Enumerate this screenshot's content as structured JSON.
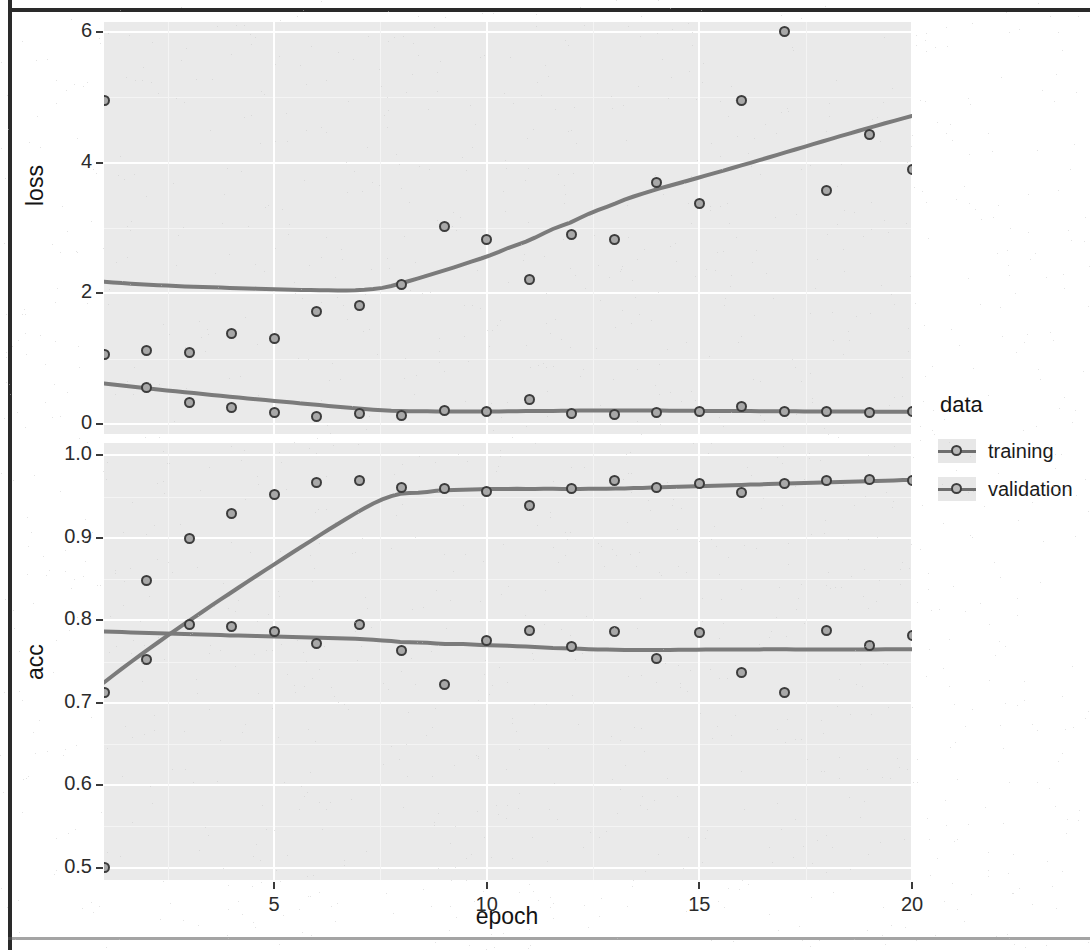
{
  "axis": {
    "x_title": "epoch",
    "x_ticks": [
      "5",
      "10",
      "15",
      "20"
    ],
    "loss_title": "loss",
    "loss_ticks": [
      "0",
      "2",
      "4",
      "6"
    ],
    "acc_title": "acc",
    "acc_ticks": [
      "0.5",
      "0.6",
      "0.7",
      "0.8",
      "0.9",
      "1.0"
    ]
  },
  "legend": {
    "title": "data",
    "items": [
      {
        "label": "training",
        "color": "#7b7b7b"
      },
      {
        "label": "validation",
        "color": "#7b7b7b"
      }
    ]
  },
  "chart_data": [
    {
      "type": "scatter",
      "panel": "loss",
      "title": "",
      "xlabel": "epoch",
      "ylabel": "loss",
      "xlim": [
        1,
        20
      ],
      "ylim": [
        -0.15,
        6.15
      ],
      "xticks": [
        5,
        10,
        15,
        20
      ],
      "yticks": [
        0,
        2,
        4,
        6
      ],
      "grid": true,
      "legend_position": "right",
      "smoother": "loess",
      "x": [
        1,
        2,
        3,
        4,
        5,
        6,
        7,
        8,
        9,
        10,
        11,
        12,
        13,
        14,
        15,
        16,
        17,
        18,
        19,
        20
      ],
      "series": [
        {
          "name": "training",
          "values": [
            1.06,
            0.56,
            0.33,
            0.25,
            0.18,
            0.12,
            0.16,
            0.14,
            0.21,
            0.2,
            0.37,
            0.16,
            0.15,
            0.18,
            0.2,
            0.27,
            0.19,
            0.19,
            0.18,
            0.19
          ]
        },
        {
          "name": "validation",
          "values": [
            4.95,
            1.12,
            1.1,
            1.39,
            1.31,
            1.72,
            1.81,
            2.13,
            3.03,
            2.83,
            2.21,
            2.9,
            2.82,
            3.69,
            3.37,
            4.95,
            6.0,
            3.58,
            4.43,
            3.89
          ]
        }
      ]
    },
    {
      "type": "scatter",
      "panel": "acc",
      "title": "",
      "xlabel": "epoch",
      "ylabel": "acc",
      "xlim": [
        1,
        20
      ],
      "ylim": [
        0.485,
        1.015
      ],
      "xticks": [
        5,
        10,
        15,
        20
      ],
      "yticks": [
        0.5,
        0.6,
        0.7,
        0.8,
        0.9,
        1.0
      ],
      "grid": true,
      "legend_position": "right",
      "smoother": "loess",
      "x": [
        1,
        2,
        3,
        4,
        5,
        6,
        7,
        8,
        9,
        10,
        11,
        12,
        13,
        14,
        15,
        16,
        17,
        18,
        19,
        20
      ],
      "series": [
        {
          "name": "training",
          "values": [
            0.5,
            0.752,
            0.899,
            0.929,
            0.952,
            0.967,
            0.969,
            0.961,
            0.96,
            0.956,
            0.939,
            0.96,
            0.97,
            0.961,
            0.966,
            0.955,
            0.966,
            0.969,
            0.971,
            0.969
          ]
        },
        {
          "name": "validation",
          "values": [
            0.713,
            0.848,
            0.795,
            0.793,
            0.786,
            0.772,
            0.795,
            0.763,
            0.722,
            0.775,
            0.788,
            0.768,
            0.786,
            0.754,
            0.785,
            0.737,
            0.713,
            0.788,
            0.77,
            0.781
          ]
        }
      ]
    }
  ]
}
